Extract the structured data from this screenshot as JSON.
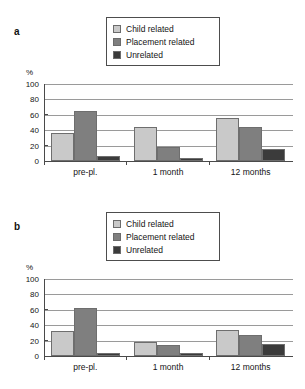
{
  "figure": {
    "panels": [
      {
        "panel_label": "a",
        "ylabel": "%"
      },
      {
        "panel_label": "b",
        "ylabel": "%"
      }
    ],
    "legend": {
      "items": [
        {
          "label": "Child related",
          "swatch": "child-related-swatch",
          "color": "#c9c9c9"
        },
        {
          "label": "Placement related",
          "swatch": "placement-related-swatch",
          "color": "#7f7f7f"
        },
        {
          "label": "Unrelated",
          "swatch": "unrelated-swatch",
          "color": "#3b3b3b"
        }
      ]
    },
    "yticks": [
      "100",
      "80",
      "60",
      "40",
      "20",
      "0"
    ],
    "xlabels": [
      "pre-pl.",
      "1 month",
      "12 months"
    ]
  },
  "chart_data": [
    {
      "type": "bar",
      "title": "a",
      "categories": [
        "pre-pl.",
        "1 month",
        "12 months"
      ],
      "series": [
        {
          "name": "Child related",
          "values": [
            36,
            44,
            56
          ],
          "color": "#c9c9c9"
        },
        {
          "name": "Placement related",
          "values": [
            65,
            18,
            44
          ],
          "color": "#7f7f7f"
        },
        {
          "name": "Unrelated",
          "values": [
            6,
            4,
            15
          ],
          "color": "#3b3b3b"
        }
      ],
      "xlabel": "",
      "ylabel": "%",
      "ylim": [
        0,
        100
      ],
      "yticks": [
        0,
        20,
        40,
        60,
        80,
        100
      ],
      "grid": true,
      "legend_position": "top-center"
    },
    {
      "type": "bar",
      "title": "b",
      "categories": [
        "pre-pl.",
        "1 month",
        "12 months"
      ],
      "series": [
        {
          "name": "Child related",
          "values": [
            32,
            18,
            34
          ],
          "color": "#c9c9c9"
        },
        {
          "name": "Placement related",
          "values": [
            63,
            14,
            27
          ],
          "color": "#7f7f7f"
        },
        {
          "name": "Unrelated",
          "values": [
            4,
            4,
            15
          ],
          "color": "#3b3b3b"
        }
      ],
      "xlabel": "",
      "ylabel": "%",
      "ylim": [
        0,
        100
      ],
      "yticks": [
        0,
        20,
        40,
        60,
        80,
        100
      ],
      "grid": true,
      "legend_position": "top-center"
    }
  ]
}
